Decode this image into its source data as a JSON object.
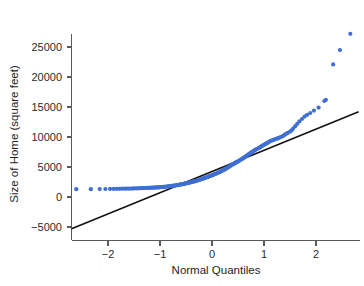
{
  "chart_data": {
    "type": "scatter",
    "title": "",
    "subtitle": "",
    "xlabel": "Normal Quantiles",
    "ylabel": "Size of Home (square feet)",
    "xlim": [
      -2.75,
      2.85
    ],
    "ylim": [
      -6500,
      28500
    ],
    "xticks": [
      -2,
      -1,
      0,
      1,
      2
    ],
    "xticklabels": [
      "−2",
      "−1",
      "0",
      "1",
      "2"
    ],
    "yticks": [
      -5000,
      0,
      5000,
      10000,
      15000,
      20000,
      25000
    ],
    "yticklabels": [
      "−5000",
      "0",
      "5000",
      "10000",
      "15000",
      "20000",
      "25000"
    ],
    "grid": false,
    "legend": null,
    "series": [
      {
        "name": "Normal Q-Q points",
        "color": "#3f6fd4",
        "marker": "circle",
        "marker_size": 2.1,
        "points": [
          [
            -2.61,
            1300
          ],
          [
            -2.33,
            1300
          ],
          [
            -2.16,
            1320
          ],
          [
            -2.05,
            1330
          ],
          [
            -1.96,
            1340
          ],
          [
            -1.89,
            1350
          ],
          [
            -1.83,
            1360
          ],
          [
            -1.78,
            1370
          ],
          [
            -1.73,
            1380
          ],
          [
            -1.68,
            1390
          ],
          [
            -1.64,
            1400
          ],
          [
            -1.6,
            1400
          ],
          [
            -1.56,
            1410
          ],
          [
            -1.53,
            1420
          ],
          [
            -1.5,
            1430
          ],
          [
            -1.46,
            1440
          ],
          [
            -1.43,
            1450
          ],
          [
            -1.4,
            1460
          ],
          [
            -1.38,
            1470
          ],
          [
            -1.35,
            1480
          ],
          [
            -1.32,
            1490
          ],
          [
            -1.3,
            1500
          ],
          [
            -1.27,
            1500
          ],
          [
            -1.25,
            1510
          ],
          [
            -1.22,
            1520
          ],
          [
            -1.2,
            1530
          ],
          [
            -1.18,
            1540
          ],
          [
            -1.16,
            1550
          ],
          [
            -1.13,
            1560
          ],
          [
            -1.11,
            1570
          ],
          [
            -1.09,
            1580
          ],
          [
            -1.07,
            1590
          ],
          [
            -1.05,
            1600
          ],
          [
            -1.03,
            1610
          ],
          [
            -1.01,
            1620
          ],
          [
            -0.99,
            1640
          ],
          [
            -0.97,
            1650
          ],
          [
            -0.95,
            1670
          ],
          [
            -0.93,
            1680
          ],
          [
            -0.92,
            1700
          ],
          [
            -0.9,
            1710
          ],
          [
            -0.88,
            1730
          ],
          [
            -0.86,
            1750
          ],
          [
            -0.84,
            1770
          ],
          [
            -0.83,
            1780
          ],
          [
            -0.81,
            1800
          ],
          [
            -0.79,
            1820
          ],
          [
            -0.77,
            1840
          ],
          [
            -0.76,
            1860
          ],
          [
            -0.74,
            1880
          ],
          [
            -0.72,
            1900
          ],
          [
            -0.71,
            1920
          ],
          [
            -0.69,
            1950
          ],
          [
            -0.67,
            1970
          ],
          [
            -0.66,
            2000
          ],
          [
            -0.64,
            2020
          ],
          [
            -0.62,
            2050
          ],
          [
            -0.61,
            2080
          ],
          [
            -0.59,
            2100
          ],
          [
            -0.58,
            2130
          ],
          [
            -0.56,
            2160
          ],
          [
            -0.54,
            2190
          ],
          [
            -0.53,
            2220
          ],
          [
            -0.51,
            2250
          ],
          [
            -0.5,
            2280
          ],
          [
            -0.48,
            2310
          ],
          [
            -0.46,
            2340
          ],
          [
            -0.45,
            2370
          ],
          [
            -0.43,
            2400
          ],
          [
            -0.42,
            2440
          ],
          [
            -0.4,
            2470
          ],
          [
            -0.38,
            2510
          ],
          [
            -0.37,
            2550
          ],
          [
            -0.35,
            2580
          ],
          [
            -0.34,
            2620
          ],
          [
            -0.32,
            2660
          ],
          [
            -0.3,
            2700
          ],
          [
            -0.29,
            2740
          ],
          [
            -0.27,
            2780
          ],
          [
            -0.26,
            2820
          ],
          [
            -0.24,
            2860
          ],
          [
            -0.23,
            2900
          ],
          [
            -0.21,
            2950
          ],
          [
            -0.19,
            3000
          ],
          [
            -0.18,
            3050
          ],
          [
            -0.16,
            3100
          ],
          [
            -0.15,
            3150
          ],
          [
            -0.13,
            3200
          ],
          [
            -0.11,
            3250
          ],
          [
            -0.1,
            3300
          ],
          [
            -0.08,
            3350
          ],
          [
            -0.07,
            3400
          ],
          [
            -0.05,
            3450
          ],
          [
            -0.04,
            3500
          ],
          [
            -0.02,
            3560
          ],
          [
            0.0,
            3620
          ],
          [
            0.02,
            3680
          ],
          [
            0.03,
            3740
          ],
          [
            0.05,
            3800
          ],
          [
            0.07,
            3860
          ],
          [
            0.08,
            3920
          ],
          [
            0.1,
            3980
          ],
          [
            0.11,
            4040
          ],
          [
            0.13,
            4100
          ],
          [
            0.15,
            4160
          ],
          [
            0.16,
            4230
          ],
          [
            0.18,
            4300
          ],
          [
            0.19,
            4370
          ],
          [
            0.21,
            4440
          ],
          [
            0.23,
            4520
          ],
          [
            0.24,
            4600
          ],
          [
            0.26,
            4680
          ],
          [
            0.27,
            4760
          ],
          [
            0.29,
            4840
          ],
          [
            0.3,
            4920
          ],
          [
            0.32,
            5000
          ],
          [
            0.34,
            5100
          ],
          [
            0.35,
            5200
          ],
          [
            0.37,
            5300
          ],
          [
            0.38,
            5380
          ],
          [
            0.4,
            5450
          ],
          [
            0.42,
            5520
          ],
          [
            0.43,
            5600
          ],
          [
            0.45,
            5680
          ],
          [
            0.46,
            5760
          ],
          [
            0.48,
            5840
          ],
          [
            0.5,
            5920
          ],
          [
            0.51,
            6000
          ],
          [
            0.53,
            6080
          ],
          [
            0.54,
            6160
          ],
          [
            0.56,
            6250
          ],
          [
            0.58,
            6340
          ],
          [
            0.59,
            6430
          ],
          [
            0.61,
            6520
          ],
          [
            0.62,
            6620
          ],
          [
            0.64,
            6720
          ],
          [
            0.66,
            6820
          ],
          [
            0.67,
            6920
          ],
          [
            0.69,
            7020
          ],
          [
            0.71,
            7120
          ],
          [
            0.72,
            7220
          ],
          [
            0.74,
            7320
          ],
          [
            0.76,
            7420
          ],
          [
            0.77,
            7520
          ],
          [
            0.79,
            7620
          ],
          [
            0.81,
            7720
          ],
          [
            0.83,
            7820
          ],
          [
            0.84,
            7920
          ],
          [
            0.86,
            8000
          ],
          [
            0.88,
            8080
          ],
          [
            0.9,
            8160
          ],
          [
            0.92,
            8250
          ],
          [
            0.93,
            8350
          ],
          [
            0.95,
            8450
          ],
          [
            0.97,
            8550
          ],
          [
            0.99,
            8650
          ],
          [
            1.01,
            8750
          ],
          [
            1.03,
            8850
          ],
          [
            1.05,
            8950
          ],
          [
            1.07,
            9050
          ],
          [
            1.09,
            9150
          ],
          [
            1.11,
            9250
          ],
          [
            1.13,
            9350
          ],
          [
            1.16,
            9450
          ],
          [
            1.18,
            9520
          ],
          [
            1.2,
            9580
          ],
          [
            1.22,
            9650
          ],
          [
            1.25,
            9720
          ],
          [
            1.27,
            9800
          ],
          [
            1.3,
            9900
          ],
          [
            1.32,
            10000
          ],
          [
            1.35,
            10100
          ],
          [
            1.38,
            10250
          ],
          [
            1.4,
            10400
          ],
          [
            1.43,
            10550
          ],
          [
            1.46,
            10700
          ],
          [
            1.5,
            10900
          ],
          [
            1.53,
            11100
          ],
          [
            1.56,
            11400
          ],
          [
            1.6,
            11800
          ],
          [
            1.64,
            12200
          ],
          [
            1.68,
            12600
          ],
          [
            1.73,
            13000
          ],
          [
            1.78,
            13400
          ],
          [
            1.83,
            13700
          ],
          [
            1.89,
            14000
          ],
          [
            1.96,
            14400
          ],
          [
            2.05,
            14900
          ],
          [
            2.16,
            16000
          ],
          [
            2.19,
            16200
          ],
          [
            2.33,
            22100
          ],
          [
            2.46,
            24500
          ],
          [
            2.66,
            27200
          ]
        ]
      }
    ],
    "reference_line": {
      "name": "normal reference line",
      "color": "#111111",
      "x_start": -2.7,
      "y_start": -5300,
      "x_end": 2.82,
      "y_end": 14200
    }
  },
  "axes": {
    "x_axis_label": "Normal Quantiles",
    "y_axis_label": "Size of Home (square feet)"
  }
}
